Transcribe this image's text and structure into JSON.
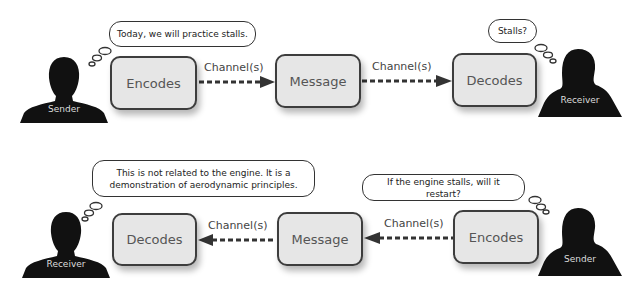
{
  "top_row": {
    "sender": {
      "label": "Sender"
    },
    "receiver": {
      "label": "Receiver"
    },
    "sender_thought": "Today, we will practice stalls.",
    "receiver_thought": "Stalls?",
    "boxes": [
      "Encodes",
      "Message",
      "Decodes"
    ],
    "channels": [
      "Channel(s)",
      "Channel(s)"
    ]
  },
  "bottom_row": {
    "receiver": {
      "label": "Receiver"
    },
    "sender": {
      "label": "Sender"
    },
    "receiver_thought": "This is not related to the engine. It is a demonstration of aerodynamic principles.",
    "sender_thought": "If the engine stalls, will it restart?",
    "boxes": [
      "Decodes",
      "Message",
      "Encodes"
    ],
    "channels": [
      "Channel(s)",
      "Channel(s)"
    ]
  },
  "colors": {
    "box_fill": "#e6e6e6",
    "box_border": "#3d3d3d",
    "arrow": "#333333",
    "silhouette": "#111111"
  }
}
